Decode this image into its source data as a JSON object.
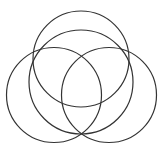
{
  "diagram": {
    "type": "overlapping-circles",
    "background": "#ffffff",
    "stroke_color": "#333333",
    "stroke_width": 1.2,
    "circles": [
      {
        "id": "top",
        "cx": 81,
        "cy": 59,
        "r": 48
      },
      {
        "id": "middle",
        "cx": 81,
        "cy": 82,
        "r": 52
      },
      {
        "id": "left",
        "cx": 54,
        "cy": 95,
        "r": 47.5
      },
      {
        "id": "right",
        "cx": 109,
        "cy": 95,
        "r": 47.5
      }
    ]
  }
}
